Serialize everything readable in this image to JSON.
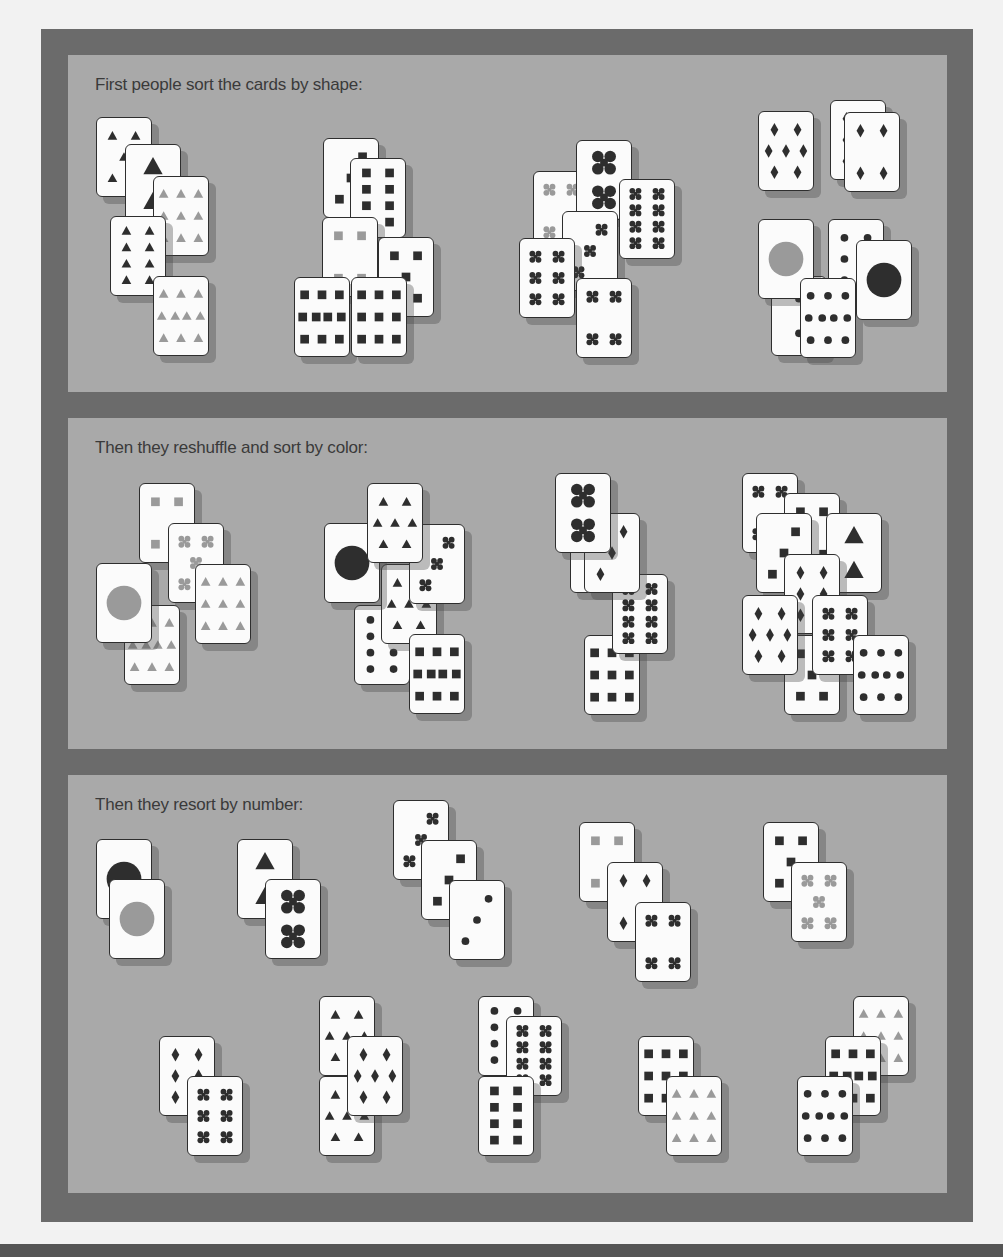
{
  "colors": {
    "frame": "#6b6b6b",
    "panel": "#a9a9a9",
    "card": "#fbfbfb",
    "dark_symbol": "#2e2e2e",
    "light_symbol": "#9a9a9a"
  },
  "panels": [
    {
      "title": "First people sort the cards by shape:",
      "top": 55,
      "height": 337,
      "cards": [
        {
          "x": 28,
          "y": 62,
          "suit": "triangle",
          "count": 5,
          "tone": "dark"
        },
        {
          "x": 57,
          "y": 89,
          "suit": "triangle",
          "count": 2,
          "tone": "dark"
        },
        {
          "x": 85,
          "y": 121,
          "suit": "triangle",
          "count": 9,
          "tone": "light"
        },
        {
          "x": 42,
          "y": 161,
          "suit": "triangle",
          "count": 8,
          "tone": "dark"
        },
        {
          "x": 85,
          "y": 221,
          "suit": "triangle",
          "count": 10,
          "tone": "light"
        },
        {
          "x": 255,
          "y": 83,
          "suit": "square",
          "count": 3,
          "tone": "dark"
        },
        {
          "x": 282,
          "y": 103,
          "suit": "square",
          "count": 8,
          "tone": "dark"
        },
        {
          "x": 254,
          "y": 162,
          "suit": "square",
          "count": 4,
          "tone": "light"
        },
        {
          "x": 310,
          "y": 182,
          "suit": "square",
          "count": 5,
          "tone": "dark"
        },
        {
          "x": 226,
          "y": 222,
          "suit": "square",
          "count": 10,
          "tone": "dark"
        },
        {
          "x": 283,
          "y": 222,
          "suit": "square",
          "count": 9,
          "tone": "dark"
        },
        {
          "x": 465,
          "y": 116,
          "suit": "cross",
          "count": 4,
          "tone": "light"
        },
        {
          "x": 508,
          "y": 85,
          "suit": "cross",
          "count": 2,
          "tone": "dark"
        },
        {
          "x": 494,
          "y": 156,
          "suit": "cross",
          "count": 3,
          "tone": "dark"
        },
        {
          "x": 551,
          "y": 124,
          "suit": "cross",
          "count": 8,
          "tone": "dark"
        },
        {
          "x": 451,
          "y": 183,
          "suit": "cross",
          "count": 6,
          "tone": "dark"
        },
        {
          "x": 508,
          "y": 223,
          "suit": "cross",
          "count": 4,
          "tone": "dark"
        },
        {
          "x": 762,
          "y": 45,
          "suit": "diamond",
          "count": 6,
          "tone": "dark"
        },
        {
          "x": 690,
          "y": 56,
          "suit": "diamond",
          "count": 7,
          "tone": "dark"
        },
        {
          "x": 776,
          "y": 57,
          "suit": "diamond",
          "count": 4,
          "tone": "dark"
        },
        {
          "x": 703,
          "y": 221,
          "suit": "circle",
          "count": 2,
          "tone": "dark"
        },
        {
          "x": 760,
          "y": 164,
          "suit": "circle",
          "count": 6,
          "tone": "dark"
        },
        {
          "x": 690,
          "y": 164,
          "suit": "circle",
          "count": 1,
          "tone": "light"
        },
        {
          "x": 732,
          "y": 223,
          "suit": "circle",
          "count": 10,
          "tone": "dark"
        },
        {
          "x": 788,
          "y": 185,
          "suit": "circle",
          "count": 1,
          "tone": "dark"
        }
      ]
    },
    {
      "title": "Then they reshuffle and sort by color:",
      "top": 418,
      "height": 331,
      "cards": [
        {
          "x": 71,
          "y": 65,
          "suit": "square",
          "count": 4,
          "tone": "light"
        },
        {
          "x": 100,
          "y": 105,
          "suit": "cross",
          "count": 5,
          "tone": "light"
        },
        {
          "x": 127,
          "y": 146,
          "suit": "triangle",
          "count": 9,
          "tone": "light"
        },
        {
          "x": 56,
          "y": 187,
          "suit": "triangle",
          "count": 10,
          "tone": "light"
        },
        {
          "x": 28,
          "y": 145,
          "suit": "circle",
          "count": 1,
          "tone": "light"
        },
        {
          "x": 286,
          "y": 187,
          "suit": "circle",
          "count": 8,
          "tone": "dark"
        },
        {
          "x": 313,
          "y": 146,
          "suit": "triangle",
          "count": 7,
          "tone": "dark"
        },
        {
          "x": 256,
          "y": 105,
          "suit": "circle",
          "count": 1,
          "tone": "dark"
        },
        {
          "x": 341,
          "y": 106,
          "suit": "cross",
          "count": 3,
          "tone": "dark"
        },
        {
          "x": 299,
          "y": 65,
          "suit": "triangle",
          "count": 7,
          "tone": "dark"
        },
        {
          "x": 341,
          "y": 216,
          "suit": "square",
          "count": 10,
          "tone": "dark"
        },
        {
          "x": 502,
          "y": 95,
          "suit": "circle",
          "count": 2,
          "tone": "dark"
        },
        {
          "x": 516,
          "y": 217,
          "suit": "square",
          "count": 9,
          "tone": "dark"
        },
        {
          "x": 544,
          "y": 156,
          "suit": "cross",
          "count": 8,
          "tone": "dark"
        },
        {
          "x": 516,
          "y": 95,
          "suit": "diamond",
          "count": 3,
          "tone": "dark"
        },
        {
          "x": 487,
          "y": 55,
          "suit": "cross",
          "count": 2,
          "tone": "dark"
        },
        {
          "x": 674,
          "y": 55,
          "suit": "cross",
          "count": 4,
          "tone": "dark"
        },
        {
          "x": 716,
          "y": 75,
          "suit": "square",
          "count": 4,
          "tone": "dark"
        },
        {
          "x": 758,
          "y": 95,
          "suit": "triangle",
          "count": 2,
          "tone": "dark"
        },
        {
          "x": 688,
          "y": 95,
          "suit": "square",
          "count": 3,
          "tone": "dark"
        },
        {
          "x": 716,
          "y": 136,
          "suit": "diamond",
          "count": 6,
          "tone": "dark"
        },
        {
          "x": 716,
          "y": 217,
          "suit": "square",
          "count": 5,
          "tone": "dark"
        },
        {
          "x": 744,
          "y": 177,
          "suit": "cross",
          "count": 6,
          "tone": "dark"
        },
        {
          "x": 674,
          "y": 177,
          "suit": "diamond",
          "count": 7,
          "tone": "dark"
        },
        {
          "x": 785,
          "y": 217,
          "suit": "circle",
          "count": 10,
          "tone": "dark"
        }
      ]
    },
    {
      "title": "Then they resort by number:",
      "top": 775,
      "height": 418,
      "cards": [
        {
          "x": 28,
          "y": 64,
          "suit": "circle",
          "count": 1,
          "tone": "dark"
        },
        {
          "x": 41,
          "y": 104,
          "suit": "circle",
          "count": 1,
          "tone": "light"
        },
        {
          "x": 169,
          "y": 64,
          "suit": "triangle",
          "count": 2,
          "tone": "dark"
        },
        {
          "x": 197,
          "y": 104,
          "suit": "cross",
          "count": 2,
          "tone": "dark"
        },
        {
          "x": 325,
          "y": 25,
          "suit": "cross",
          "count": 3,
          "tone": "dark"
        },
        {
          "x": 353,
          "y": 65,
          "suit": "square",
          "count": 3,
          "tone": "dark"
        },
        {
          "x": 381,
          "y": 105,
          "suit": "circle",
          "count": 3,
          "tone": "dark"
        },
        {
          "x": 511,
          "y": 47,
          "suit": "square",
          "count": 4,
          "tone": "light"
        },
        {
          "x": 539,
          "y": 87,
          "suit": "diamond",
          "count": 4,
          "tone": "dark"
        },
        {
          "x": 567,
          "y": 127,
          "suit": "cross",
          "count": 4,
          "tone": "dark"
        },
        {
          "x": 695,
          "y": 47,
          "suit": "square",
          "count": 5,
          "tone": "dark"
        },
        {
          "x": 723,
          "y": 87,
          "suit": "cross",
          "count": 5,
          "tone": "light"
        },
        {
          "x": 91,
          "y": 261,
          "suit": "diamond",
          "count": 6,
          "tone": "dark"
        },
        {
          "x": 119,
          "y": 301,
          "suit": "cross",
          "count": 6,
          "tone": "dark"
        },
        {
          "x": 251,
          "y": 221,
          "suit": "triangle",
          "count": 7,
          "tone": "dark"
        },
        {
          "x": 251,
          "y": 301,
          "suit": "triangle",
          "count": 7,
          "tone": "dark"
        },
        {
          "x": 279,
          "y": 261,
          "suit": "diamond",
          "count": 7,
          "tone": "dark"
        },
        {
          "x": 410,
          "y": 221,
          "suit": "circle",
          "count": 8,
          "tone": "dark"
        },
        {
          "x": 438,
          "y": 241,
          "suit": "cross",
          "count": 8,
          "tone": "dark"
        },
        {
          "x": 410,
          "y": 301,
          "suit": "square",
          "count": 8,
          "tone": "dark"
        },
        {
          "x": 570,
          "y": 261,
          "suit": "square",
          "count": 9,
          "tone": "dark"
        },
        {
          "x": 598,
          "y": 301,
          "suit": "triangle",
          "count": 9,
          "tone": "light"
        },
        {
          "x": 785,
          "y": 221,
          "suit": "triangle",
          "count": 9,
          "tone": "light"
        },
        {
          "x": 757,
          "y": 261,
          "suit": "square",
          "count": 10,
          "tone": "dark"
        },
        {
          "x": 729,
          "y": 301,
          "suit": "circle",
          "count": 10,
          "tone": "dark"
        }
      ]
    }
  ]
}
